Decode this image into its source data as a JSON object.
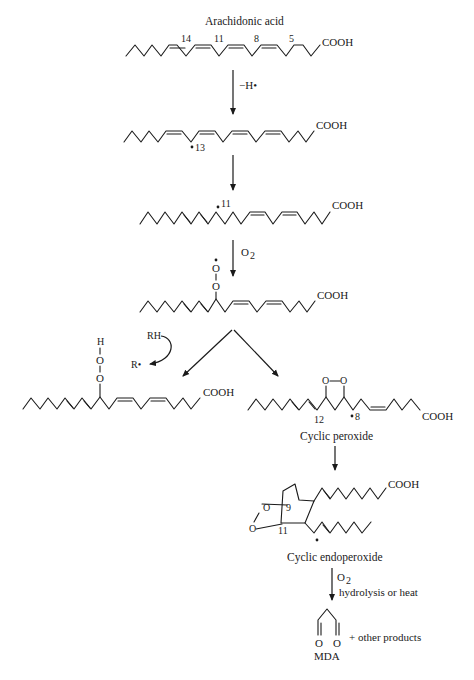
{
  "diagram": {
    "title": "Arachidonic acid",
    "type": "reaction-pathway",
    "molecules": {
      "arachidonic_acid": {
        "name": "Arachidonic acid",
        "end_group": "COOH",
        "double_bond_positions": [
          "14",
          "11",
          "8",
          "5"
        ]
      },
      "radical_13": {
        "end_group": "COOH",
        "radical_label": "13"
      },
      "radical_11": {
        "end_group": "COOH",
        "radical_label": "11"
      },
      "peroxyl_radical": {
        "end_group": "COOH",
        "atom_top": "O",
        "atom_bottom": "O"
      },
      "hydroperoxide": {
        "end_group": "COOH",
        "atom_h": "H",
        "atom_o1": "O",
        "atom_o2": "O"
      },
      "cyclic_peroxide": {
        "name": "Cyclic peroxide",
        "end_group": "COOH",
        "atom_o1": "O",
        "atom_o2": "O",
        "position_label_1": "12",
        "radical_label": "8"
      },
      "cyclic_endoperoxide": {
        "name": "Cyclic endoperoxide",
        "end_group": "COOH",
        "atom_o1": "O",
        "atom_o2": "O",
        "position_label_1": "9",
        "position_label_2": "11"
      },
      "mda": {
        "name": "MDA",
        "atom_o1": "O",
        "atom_o2": "O",
        "extra": "+ other products"
      }
    },
    "steps": [
      {
        "id": "step1",
        "reagent": "−H•"
      },
      {
        "id": "step2",
        "reagent": ""
      },
      {
        "id": "step3",
        "reagent": "O",
        "reagent_sub": "2"
      },
      {
        "id": "step4a",
        "reagent_in": "RH",
        "reagent_out": "R•"
      },
      {
        "id": "step4b",
        "reagent": ""
      },
      {
        "id": "step5",
        "reagent": ""
      },
      {
        "id": "step6",
        "reagent": "O",
        "reagent_sub": "2",
        "condition": "hydrolysis or heat"
      }
    ]
  }
}
